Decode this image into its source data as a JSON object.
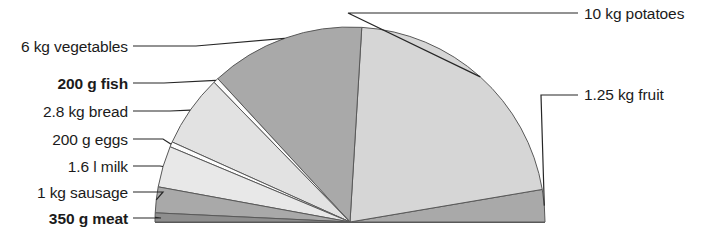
{
  "chart_data": {
    "type": "pie",
    "variant": "semicircle",
    "title": "",
    "subtitle": "",
    "xlabel": "",
    "ylabel": "",
    "total_sweep_degrees": 180,
    "total_weight_kg": 23.4,
    "unit": "kg",
    "legend_position": "callout-labels",
    "grid": false,
    "center": {
      "x": 350,
      "y": 222
    },
    "radius": 195,
    "labels": [
      "10 kg potatoes",
      "1.25 kg fruit",
      "6 kg vegetables",
      "200 g fish",
      "2.8 kg bread",
      "200 g eggs",
      "1.6 l milk",
      "1 kg sausage",
      "350 g meat"
    ],
    "slices": [
      {
        "name": "fruit",
        "label": "1.25 kg fruit",
        "value": 1.25,
        "display_value": "1.25",
        "display_unit": "kg",
        "color": "#a9a9a9",
        "bold": false,
        "side": "right"
      },
      {
        "name": "potatoes",
        "label": "10 kg potatoes",
        "value": 10,
        "display_value": "10",
        "display_unit": "kg",
        "color": "#d6d6d6",
        "bold": false,
        "side": "right"
      },
      {
        "name": "vegetables",
        "label": "6 kg vegetables",
        "value": 6,
        "display_value": "6",
        "display_unit": "kg",
        "color": "#a9a9a9",
        "bold": false,
        "side": "left"
      },
      {
        "name": "fish",
        "label": "200 g fish",
        "value": 0.2,
        "display_value": "200",
        "display_unit": "g",
        "color": "#fdfdfd",
        "bold": true,
        "side": "left"
      },
      {
        "name": "bread",
        "label": "2.8 kg bread",
        "value": 2.8,
        "display_value": "2.8",
        "display_unit": "kg",
        "color": "#e2e2e2",
        "bold": false,
        "side": "left"
      },
      {
        "name": "eggs",
        "label": "200 g eggs",
        "value": 0.2,
        "display_value": "200",
        "display_unit": "g",
        "color": "#fdfdfd",
        "bold": false,
        "side": "left"
      },
      {
        "name": "milk",
        "label": "1.6 l milk",
        "value": 1.6,
        "display_value": "1.6",
        "display_unit": "l",
        "color": "#e8e8e8",
        "bold": false,
        "side": "left"
      },
      {
        "name": "sausage",
        "label": "1 kg sausage",
        "value": 1,
        "display_value": "1",
        "display_unit": "kg",
        "color": "#a9a9a9",
        "bold": false,
        "side": "left"
      },
      {
        "name": "meat",
        "label": "350 g meat",
        "value": 0.35,
        "display_value": "350",
        "display_unit": "g",
        "color": "#8e8e8e",
        "bold": true,
        "side": "left"
      }
    ],
    "colors": {
      "light_gray": "#d6d6d6",
      "medium_gray": "#a9a9a9",
      "dark_gray": "#8e8e8e",
      "pale_gray": "#e2e2e2",
      "white": "#fdfdfd",
      "stroke": "#595959",
      "leader": "#262626",
      "text": "#1b1b1b"
    }
  },
  "labels": {
    "potatoes": "10 kg potatoes",
    "fruit": "1.25 kg fruit",
    "vegetables": "6 kg vegetables",
    "fish": "200 g fish",
    "bread": "2.8 kg bread",
    "eggs": "200 g eggs",
    "milk": "1.6 l milk",
    "sausage": "1 kg sausage",
    "meat": "350 g meat"
  }
}
